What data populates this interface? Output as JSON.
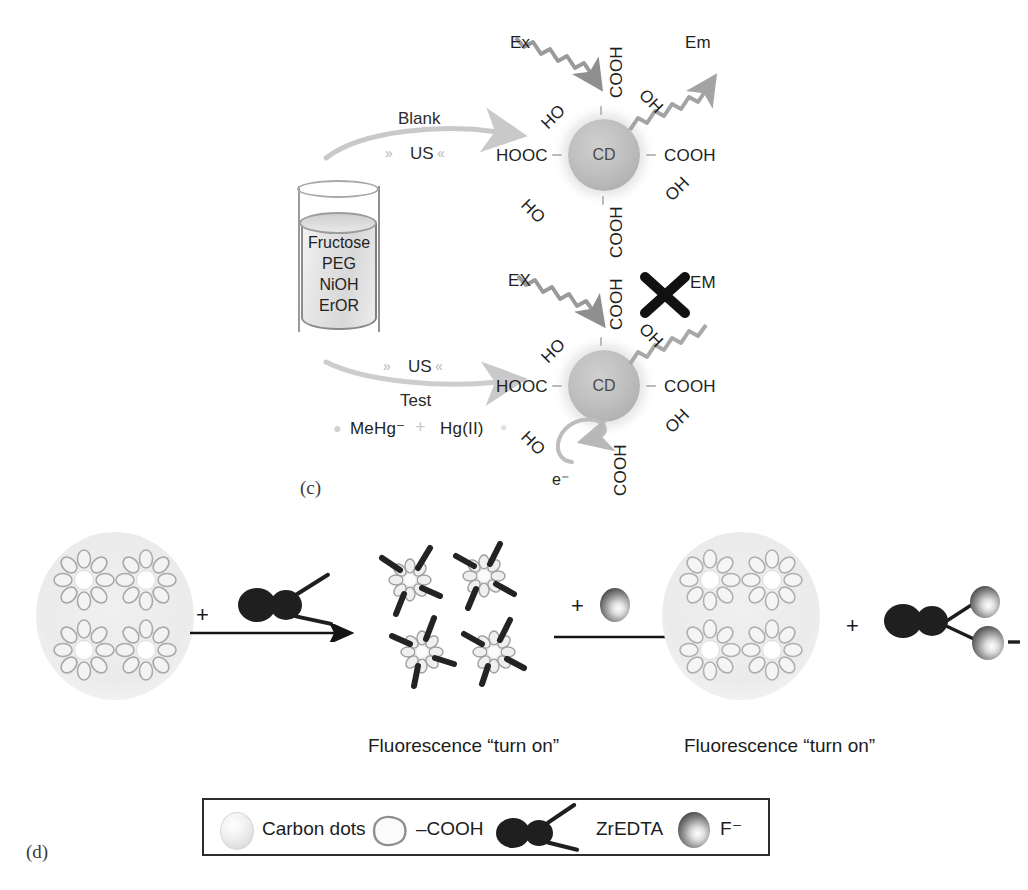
{
  "figure": {
    "panels": [
      {
        "id": "c",
        "label": "(c)"
      },
      {
        "id": "d",
        "label": "(d)"
      }
    ]
  },
  "panel_c": {
    "label": "(c)",
    "beaker": {
      "name": "reagent-beaker",
      "contents": [
        "Fructose",
        "PEG",
        "NiOH",
        "ErOR"
      ]
    },
    "routes": [
      {
        "name": "blank-route",
        "above_label": "Blank",
        "below_label": "US",
        "sonication_marks": "» «"
      },
      {
        "name": "test-route",
        "above_label": "US",
        "below_label": "Test",
        "sonication_marks": "» «",
        "analytes": [
          "MeHg⁻",
          "Hg(II)"
        ],
        "analyte_separator": "+"
      }
    ],
    "cd_top": {
      "name": "carbon-dot-fluorescent",
      "core_label": "CD",
      "excitation_label": "Ex",
      "emission_label": "Em",
      "emission_blocked": false,
      "surface_groups": [
        {
          "position": "top",
          "text": "COOH"
        },
        {
          "position": "upper-left",
          "text": "HO"
        },
        {
          "position": "upper-right",
          "text": "OH"
        },
        {
          "position": "left",
          "text": "HOOC"
        },
        {
          "position": "right",
          "text": "COOH"
        },
        {
          "position": "lower-left",
          "text": "HO"
        },
        {
          "position": "lower-right",
          "text": "OH"
        },
        {
          "position": "bottom",
          "text": "COOH"
        }
      ]
    },
    "cd_bottom": {
      "name": "carbon-dot-quenched",
      "core_label": "CD",
      "excitation_label": "EX",
      "emission_label": "EM",
      "emission_blocked": true,
      "block_marker": "X",
      "electron_label": "e⁻",
      "surface_groups": [
        {
          "position": "top",
          "text": "COOH"
        },
        {
          "position": "upper-left",
          "text": "HO"
        },
        {
          "position": "upper-right",
          "text": "OH"
        },
        {
          "position": "left",
          "text": "HOOC"
        },
        {
          "position": "right",
          "text": "COOH"
        },
        {
          "position": "lower-left",
          "text": "HO"
        },
        {
          "position": "lower-right",
          "text": "OH"
        },
        {
          "position": "bottom",
          "text": "COOH"
        }
      ]
    }
  },
  "panel_d": {
    "label": "(d)",
    "steps": [
      {
        "name": "state-aggregated-carbon-dots",
        "caption": ""
      },
      {
        "name": "reagent-zredta",
        "plus": "+"
      },
      {
        "name": "state-dots-bound-zredta",
        "caption": "Fluorescence “turn on”"
      },
      {
        "name": "reagent-fluoride",
        "plus": "+"
      },
      {
        "name": "state-dots-released",
        "caption": "Fluorescence “turn on”"
      },
      {
        "name": "product-zredta-fluoride",
        "plus": "+"
      }
    ],
    "captions": [
      "Fluorescence “turn on”",
      "Fluorescence “turn on”"
    ],
    "legend": {
      "name": "symbol-legend",
      "items": [
        {
          "glyph": "carbon-dot-sphere",
          "label": "Carbon dots"
        },
        {
          "glyph": "cooh-teardrop",
          "label": "–COOH"
        },
        {
          "glyph": "zredta-blob",
          "label": "ZrEDTA"
        },
        {
          "glyph": "fluoride-sphere",
          "label": "F⁻"
        }
      ]
    }
  },
  "colors": {
    "ink": "#231f20",
    "dark_glyph": "#201f1f",
    "cd_sphere": "#c0c0c0",
    "halo": "#ebebeb",
    "arrow": "#1a1a1a",
    "squiggle": "#9b9b9b"
  }
}
